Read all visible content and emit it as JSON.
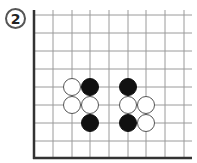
{
  "diagram": {
    "label": "2",
    "grid": {
      "x_lines": [
        34,
        53,
        72,
        90,
        109,
        128,
        146,
        165,
        184
      ],
      "y_lines": [
        15,
        33,
        51,
        69,
        87,
        105,
        123,
        141
      ],
      "left_edge_x": 34,
      "bottom_edge_y": 158,
      "right_extent_x": 192,
      "top_extent_y": 10,
      "line_color": "#9a9a9a",
      "edge_color": "#333333"
    },
    "stone_radius": 9,
    "stones": [
      {
        "color": "white",
        "x": 72,
        "y": 87
      },
      {
        "color": "black",
        "x": 90,
        "y": 87
      },
      {
        "color": "white",
        "x": 72,
        "y": 105
      },
      {
        "color": "white",
        "x": 90,
        "y": 105
      },
      {
        "color": "black",
        "x": 90,
        "y": 123
      },
      {
        "color": "black",
        "x": 128,
        "y": 87
      },
      {
        "color": "white",
        "x": 128,
        "y": 105
      },
      {
        "color": "white",
        "x": 146,
        "y": 105
      },
      {
        "color": "black",
        "x": 128,
        "y": 123
      },
      {
        "color": "white",
        "x": 146,
        "y": 123
      }
    ]
  }
}
